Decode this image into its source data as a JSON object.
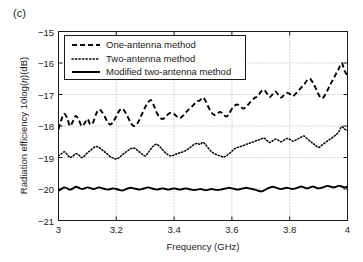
{
  "figure": {
    "panel_label": "(c)",
    "axis": {
      "xlabel": "Frequency (GHz)",
      "ylabel_prefix": "Radiation efficiency 10log(",
      "ylabel_symbol": "η",
      "ylabel_suffix": ")(dB)",
      "xticks": [
        "3",
        "3.2",
        "3.4",
        "3.6",
        "3.8",
        "4"
      ],
      "yticks": [
        "−15",
        "−16",
        "−17",
        "−18",
        "−19",
        "−20",
        "−21"
      ]
    },
    "legend": {
      "items": [
        {
          "label": "One-antenna method",
          "style": "dashed"
        },
        {
          "label": "Two-antenna method",
          "style": "dotted"
        },
        {
          "label": "Modified two-antenna method",
          "style": "solid"
        }
      ]
    },
    "colors": {
      "axis": "#1a1a1a",
      "grid": "#9a9a9a",
      "curve": "#000000",
      "background": "#ffffff"
    }
  },
  "chart_data": {
    "type": "line",
    "title": "",
    "subtitle": "(c)",
    "xlabel": "Frequency (GHz)",
    "ylabel": "Radiation efficiency 10log(η)(dB)",
    "xlim": [
      3,
      4
    ],
    "ylim": [
      -21,
      -15
    ],
    "xticks": [
      3,
      3.2,
      3.4,
      3.6,
      3.8,
      4
    ],
    "yticks": [
      -21,
      -20,
      -19,
      -18,
      -17,
      -16,
      -15
    ],
    "grid": true,
    "legend_position": "upper-left",
    "x": [
      3.0,
      3.01,
      3.02,
      3.03,
      3.04,
      3.05,
      3.06,
      3.07,
      3.08,
      3.09,
      3.1,
      3.11,
      3.12,
      3.13,
      3.14,
      3.15,
      3.16,
      3.17,
      3.18,
      3.19,
      3.2,
      3.21,
      3.22,
      3.23,
      3.24,
      3.25,
      3.26,
      3.27,
      3.28,
      3.29,
      3.3,
      3.31,
      3.32,
      3.33,
      3.34,
      3.35,
      3.36,
      3.37,
      3.38,
      3.39,
      3.4,
      3.41,
      3.42,
      3.43,
      3.44,
      3.45,
      3.46,
      3.47,
      3.48,
      3.49,
      3.5,
      3.51,
      3.52,
      3.53,
      3.54,
      3.55,
      3.56,
      3.57,
      3.58,
      3.59,
      3.6,
      3.61,
      3.62,
      3.63,
      3.64,
      3.65,
      3.66,
      3.67,
      3.68,
      3.69,
      3.7,
      3.71,
      3.72,
      3.73,
      3.74,
      3.75,
      3.76,
      3.77,
      3.78,
      3.79,
      3.8,
      3.81,
      3.82,
      3.83,
      3.84,
      3.85,
      3.86,
      3.87,
      3.88,
      3.89,
      3.9,
      3.91,
      3.92,
      3.93,
      3.94,
      3.95,
      3.96,
      3.97,
      3.98,
      3.99,
      4.0
    ],
    "series": [
      {
        "name": "One-antenna method",
        "style": "dashed",
        "values": [
          -18.1,
          -17.8,
          -17.62,
          -17.75,
          -18.0,
          -17.85,
          -17.68,
          -17.8,
          -18.0,
          -17.92,
          -17.78,
          -17.95,
          -17.88,
          -17.62,
          -17.48,
          -17.55,
          -17.7,
          -17.88,
          -17.95,
          -17.85,
          -17.7,
          -17.52,
          -17.45,
          -17.55,
          -17.72,
          -17.9,
          -18.0,
          -17.95,
          -17.8,
          -17.6,
          -17.4,
          -17.25,
          -17.18,
          -17.35,
          -17.58,
          -17.72,
          -17.78,
          -17.72,
          -17.62,
          -17.58,
          -17.62,
          -17.7,
          -17.75,
          -17.68,
          -17.58,
          -17.48,
          -17.4,
          -17.3,
          -17.22,
          -17.18,
          -17.1,
          -17.22,
          -17.42,
          -17.58,
          -17.65,
          -17.6,
          -17.55,
          -17.62,
          -17.7,
          -17.62,
          -17.45,
          -17.35,
          -17.32,
          -17.38,
          -17.45,
          -17.38,
          -17.28,
          -17.18,
          -17.1,
          -17.05,
          -16.92,
          -16.85,
          -16.95,
          -17.08,
          -17.0,
          -16.9,
          -17.0,
          -17.1,
          -17.02,
          -16.95,
          -16.98,
          -17.05,
          -16.98,
          -16.88,
          -16.78,
          -16.68,
          -16.55,
          -16.5,
          -16.62,
          -16.8,
          -17.0,
          -17.12,
          -17.05,
          -16.88,
          -16.7,
          -16.52,
          -16.35,
          -16.18,
          -16.0,
          -16.25,
          -16.4
        ]
      },
      {
        "name": "Two-antenna method",
        "style": "dotted",
        "values": [
          -18.95,
          -18.88,
          -18.82,
          -18.9,
          -19.0,
          -18.95,
          -18.88,
          -18.92,
          -19.0,
          -18.95,
          -18.85,
          -18.78,
          -18.7,
          -18.65,
          -18.68,
          -18.75,
          -18.82,
          -18.9,
          -18.98,
          -19.02,
          -19.05,
          -19.0,
          -18.92,
          -18.85,
          -18.78,
          -18.72,
          -18.7,
          -18.75,
          -18.82,
          -18.9,
          -18.95,
          -18.85,
          -18.72,
          -18.62,
          -18.58,
          -18.65,
          -18.75,
          -18.85,
          -18.92,
          -18.95,
          -18.92,
          -18.88,
          -18.85,
          -18.82,
          -18.78,
          -18.72,
          -18.65,
          -18.58,
          -18.55,
          -18.58,
          -18.52,
          -18.6,
          -18.72,
          -18.82,
          -18.88,
          -18.92,
          -18.95,
          -18.98,
          -18.95,
          -18.88,
          -18.8,
          -18.72,
          -18.68,
          -18.65,
          -18.62,
          -18.58,
          -18.55,
          -18.52,
          -18.48,
          -18.45,
          -18.42,
          -18.38,
          -18.45,
          -18.52,
          -18.48,
          -18.42,
          -18.45,
          -18.5,
          -18.45,
          -18.4,
          -18.42,
          -18.48,
          -18.45,
          -18.4,
          -18.35,
          -18.32,
          -18.4,
          -18.48,
          -18.55,
          -18.62,
          -18.68,
          -18.62,
          -18.55,
          -18.48,
          -18.42,
          -18.35,
          -18.28,
          -18.18,
          -18.02,
          -18.1,
          -18.15
        ]
      },
      {
        "name": "Modified two-antenna method",
        "style": "solid",
        "values": [
          -20.05,
          -20.0,
          -19.95,
          -19.98,
          -20.02,
          -19.98,
          -19.93,
          -19.96,
          -20.0,
          -19.98,
          -19.95,
          -19.97,
          -20.0,
          -19.98,
          -19.95,
          -19.97,
          -20.0,
          -20.02,
          -20.0,
          -19.98,
          -20.0,
          -20.03,
          -20.05,
          -20.02,
          -19.98,
          -19.96,
          -19.98,
          -20.0,
          -20.02,
          -20.0,
          -19.97,
          -19.95,
          -19.97,
          -20.0,
          -20.02,
          -20.0,
          -19.98,
          -20.0,
          -20.02,
          -20.0,
          -19.98,
          -20.0,
          -20.02,
          -20.0,
          -19.98,
          -20.0,
          -20.02,
          -20.03,
          -20.02,
          -20.0,
          -20.02,
          -20.04,
          -20.02,
          -20.0,
          -20.02,
          -20.03,
          -20.02,
          -20.0,
          -19.98,
          -19.96,
          -19.98,
          -20.0,
          -20.02,
          -20.0,
          -19.98,
          -19.96,
          -19.98,
          -20.0,
          -20.02,
          -20.05,
          -20.08,
          -20.05,
          -20.0,
          -19.96,
          -19.93,
          -19.95,
          -19.98,
          -20.0,
          -19.98,
          -19.96,
          -19.98,
          -20.0,
          -19.98,
          -19.95,
          -19.92,
          -19.95,
          -19.98,
          -19.95,
          -19.92,
          -19.95,
          -19.98,
          -19.96,
          -19.93,
          -19.9,
          -19.92,
          -19.95,
          -19.93,
          -19.9,
          -19.92,
          -19.95,
          -19.93
        ]
      }
    ]
  }
}
